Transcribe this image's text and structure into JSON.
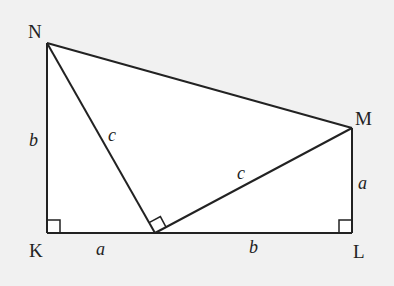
{
  "diagram": {
    "vertices": [
      {
        "id": "N",
        "label": "N",
        "x": 47,
        "y": 43
      },
      {
        "id": "K",
        "label": "K",
        "x": 47,
        "y": 233
      },
      {
        "id": "L",
        "label": "L",
        "x": 352,
        "y": 233
      },
      {
        "id": "M",
        "label": "M",
        "x": 352,
        "y": 128
      },
      {
        "id": "P",
        "label": "",
        "x": 155,
        "y": 233
      }
    ],
    "side_labels": {
      "NK": "b",
      "KP": "a",
      "PL": "b",
      "LM": "a",
      "NP": "c",
      "PM": "c"
    },
    "right_angles": [
      "K",
      "L",
      "P"
    ],
    "colors": {
      "background": "#f1f1f1",
      "fill": "#ffffff",
      "stroke": "#222222"
    }
  }
}
